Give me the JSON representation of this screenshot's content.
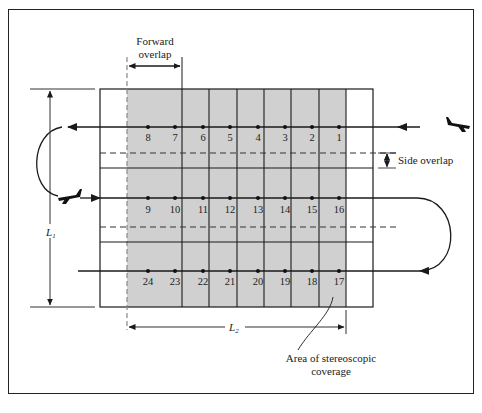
{
  "diagram": {
    "labels": {
      "forward_overlap_line1": "Forward",
      "forward_overlap_line2": "overlap",
      "side_overlap": "Side overlap",
      "L1": "L",
      "L1_sub": "1",
      "L2": "L",
      "L2_sub": "2",
      "stereo_line1": "Area of stereoscopic",
      "stereo_line2": "coverage"
    },
    "flight_lines": [
      {
        "direction": "right-to-left",
        "exposures": [
          "8",
          "7",
          "6",
          "5",
          "4",
          "3",
          "2",
          "1"
        ]
      },
      {
        "direction": "left-to-right",
        "exposures": [
          "9",
          "10",
          "11",
          "12",
          "13",
          "14",
          "15",
          "16"
        ]
      },
      {
        "direction": "right-to-left",
        "exposures": [
          "24",
          "23",
          "22",
          "21",
          "20",
          "19",
          "18",
          "17"
        ]
      }
    ],
    "colors": {
      "shade": "#cfcfcf",
      "line": "#1a1a1a"
    }
  }
}
